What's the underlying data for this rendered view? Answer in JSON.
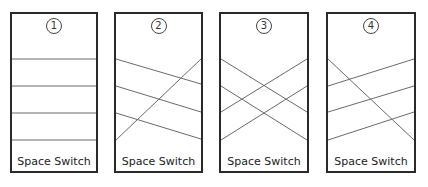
{
  "diagram": {
    "panels": [
      {
        "number": "1",
        "label": "Space Switch",
        "connections": [
          [
            59,
            59
          ],
          [
            86,
            86
          ],
          [
            113,
            113
          ],
          [
            140,
            140
          ]
        ]
      },
      {
        "number": "2",
        "label": "Space Switch",
        "connections": [
          [
            59,
            84
          ],
          [
            86,
            112
          ],
          [
            113,
            139
          ],
          [
            140,
            59
          ]
        ]
      },
      {
        "number": "3",
        "label": "Space Switch",
        "connections": [
          [
            59,
            112
          ],
          [
            86,
            140
          ],
          [
            112,
            59
          ],
          [
            140,
            86
          ]
        ]
      },
      {
        "number": "4",
        "label": "Space Switch",
        "connections": [
          [
            59,
            140
          ],
          [
            86,
            59
          ],
          [
            112,
            86
          ],
          [
            140,
            112
          ]
        ]
      }
    ],
    "colors": {
      "border": "#2a2a2a",
      "line": "#6a6a6a",
      "background": "#ffffff"
    }
  }
}
